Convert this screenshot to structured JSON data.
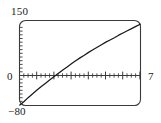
{
  "chart_data": {
    "type": "line",
    "title": "",
    "xlabel": "",
    "ylabel": "",
    "xlim": [
      0,
      7
    ],
    "ylim": [
      -80,
      150
    ],
    "grid": false,
    "legend": null,
    "annotations": [],
    "tick_labels": {
      "x_min": "0",
      "x_max": "7",
      "y_min": "−80",
      "y_max": "150"
    },
    "axes": {
      "x_axis_drawn_at_y": 0,
      "x_major_tick_step": 1,
      "x_minor_tick_step": 0.25,
      "y_minor_tick_step": 10,
      "frame": "rounded-rectangle"
    },
    "series": [
      {
        "name": "curve",
        "color": "#1a1a1a",
        "x": [
          0,
          0.25,
          0.5,
          0.75,
          1,
          1.25,
          1.5,
          1.75,
          2,
          2.25,
          2.5,
          2.75,
          3,
          3.25,
          3.5,
          3.75,
          4,
          4.25,
          4.5,
          4.75,
          5,
          5.25,
          5.5,
          5.75,
          6,
          6.25,
          6.5,
          6.75,
          7
        ],
        "y": [
          -80,
          -70,
          -59,
          -49,
          -39,
          -29,
          -20,
          -11,
          -2,
          7,
          16,
          24,
          33,
          41,
          49,
          56,
          64,
          71,
          78,
          85,
          92,
          98,
          104,
          111,
          117,
          123,
          129,
          135,
          141
        ]
      }
    ]
  },
  "figure": {
    "background_color": "#ffffff",
    "frame_color": "#3a3a3a",
    "curve_color": "#1a1a1a"
  }
}
